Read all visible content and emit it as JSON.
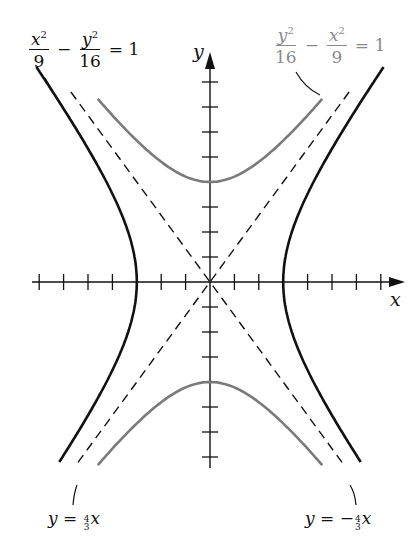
{
  "chart_data": {
    "type": "line",
    "title": "",
    "xlabel": "x",
    "ylabel": "y",
    "xlim": [
      -7.3,
      8.0
    ],
    "ylim": [
      -7.5,
      9.0
    ],
    "grid": false,
    "legend": "none (labels with leader lines)",
    "origin_px": [
      210,
      282
    ],
    "scale_px": {
      "x": 24.4,
      "y": 25.0
    },
    "x_ticks": [
      -7,
      -6,
      -5,
      -4,
      -3,
      -2,
      -1,
      1,
      2,
      3,
      4,
      5,
      6,
      7
    ],
    "y_ticks": [
      -7,
      -6,
      -5,
      -4,
      -3,
      -2,
      -1,
      1,
      2,
      3,
      4,
      5,
      6,
      7,
      8
    ],
    "series": [
      {
        "name": "x^2/9 - y^2/16 = 1",
        "kind": "hyperbola",
        "a": 3,
        "b": 4,
        "opens": "horizontal",
        "vertices": [
          [
            -3,
            0
          ],
          [
            3,
            0
          ]
        ],
        "color": "#111111",
        "style": "solid",
        "y_range": [
          -7.2,
          9.0
        ]
      },
      {
        "name": "y^2/16 - x^2/9 = 1",
        "kind": "hyperbola",
        "a": 4,
        "b": 3,
        "opens": "vertical",
        "vertices": [
          [
            0,
            4
          ],
          [
            0,
            -4
          ]
        ],
        "color": "#7a7a7a",
        "style": "solid",
        "x_range": [
          -4.6,
          4.6
        ]
      },
      {
        "name": "y = 4/3 x",
        "kind": "asymptote",
        "slope": 1.3333,
        "color": "#111111",
        "style": "dashed"
      },
      {
        "name": "y = -4/3 x",
        "kind": "asymptote",
        "slope": -1.3333,
        "color": "#111111",
        "style": "dashed"
      }
    ],
    "annotations": [
      {
        "text": "x²/9 − y²/16 = 1",
        "position": "top-left",
        "color": "#111111"
      },
      {
        "text": "y²/16 − x²/9 = 1",
        "position": "top-right",
        "color": "#8a8a8a"
      },
      {
        "text": "y = (4/3)x",
        "position": "bottom-left"
      },
      {
        "text": "y = −(4/3)x",
        "position": "bottom-right"
      }
    ]
  },
  "labels": {
    "eq1": {
      "num1": "x",
      "den1": "9",
      "minus": "−",
      "num2": "y",
      "den2": "16",
      "equals": "= 1",
      "exp": "2"
    },
    "eq2": {
      "num1": "y",
      "den1": "16",
      "minus": "−",
      "num2": "x",
      "den2": "9",
      "equals": "= 1",
      "exp": "2"
    },
    "asym1": {
      "lhs": "y",
      "eq": "=",
      "fnum": "4",
      "fden": "3",
      "var": "x",
      "sign": ""
    },
    "asym2": {
      "lhs": "y",
      "eq": "=",
      "fnum": "4",
      "fden": "3",
      "var": "x",
      "sign": "−"
    },
    "x_axis": "x",
    "y_axis": "y"
  },
  "colors": {
    "black_curve": "#111111",
    "gray_curve": "#7a7a7a",
    "axes": "#111111"
  }
}
